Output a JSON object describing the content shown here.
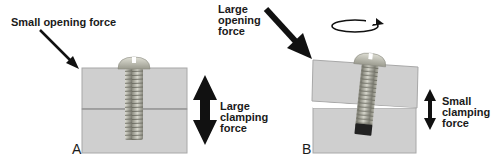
{
  "panels": [
    {
      "id": "A",
      "letter": "A",
      "opening_force_label": "Small opening force",
      "clamping_force_label": "Large\nclamping\nforce",
      "joint_state": "closed"
    },
    {
      "id": "B",
      "letter": "B",
      "opening_force_label": "Large\nopening\nforce",
      "clamping_force_label": "Small\nclamping\nforce",
      "joint_state": "gapped",
      "rotation_icon": "rotate-clockwise-icon"
    }
  ],
  "colors": {
    "block": "#cfcfcf",
    "block_edge": "#a8a8a8",
    "joint_line": "#8a8a8a",
    "screw": "#b5b5a8",
    "screw_dark": "#6e6e66",
    "arrow": "#111111",
    "text": "#1a1a1a"
  }
}
